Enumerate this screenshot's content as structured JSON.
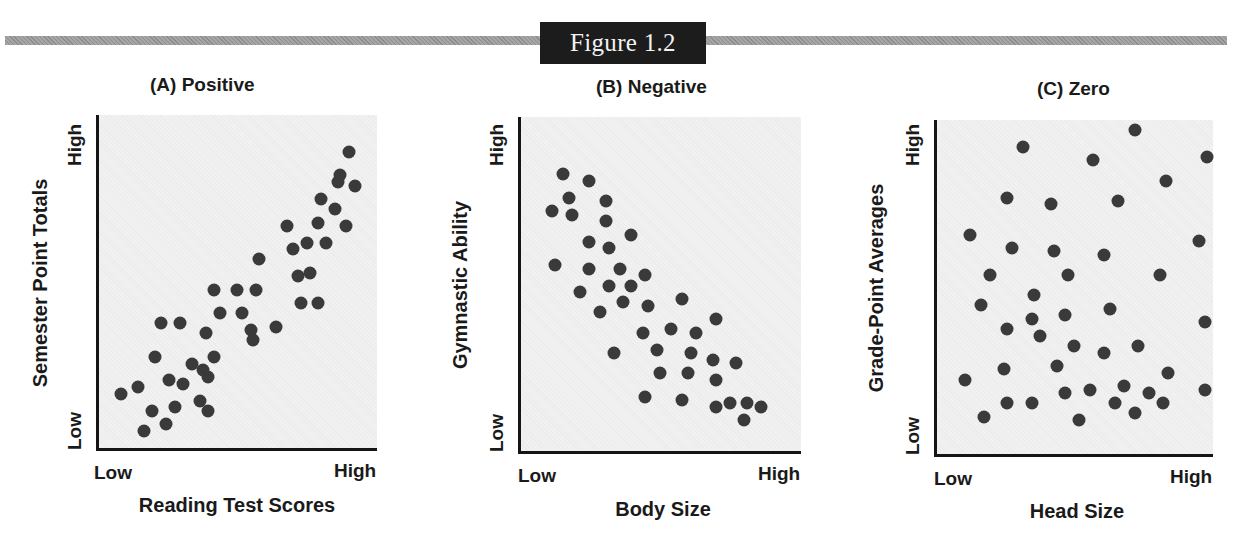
{
  "figure": {
    "label": "Figure 1.2"
  },
  "chart_data": [
    {
      "type": "scatter",
      "title": "(A) Positive",
      "xlabel": "Reading Test Scores",
      "ylabel": "Semester Point Totals",
      "x_ticks": [
        "Low",
        "High"
      ],
      "y_ticks": [
        "Low",
        "High"
      ],
      "xlim": [
        0,
        100
      ],
      "ylim": [
        0,
        100
      ],
      "grid": false,
      "points": [
        [
          9,
          17
        ],
        [
          15,
          19
        ],
        [
          20,
          12
        ],
        [
          17,
          6
        ],
        [
          21,
          28
        ],
        [
          23,
          38
        ],
        [
          25,
          8
        ],
        [
          30,
          38
        ],
        [
          28,
          13
        ],
        [
          26,
          21
        ],
        [
          31,
          20
        ],
        [
          34,
          26
        ],
        [
          37,
          15
        ],
        [
          38,
          24
        ],
        [
          39,
          35
        ],
        [
          40,
          22
        ],
        [
          42,
          28
        ],
        [
          40,
          12
        ],
        [
          42,
          48
        ],
        [
          44,
          41
        ],
        [
          50,
          48
        ],
        [
          52,
          41
        ],
        [
          55,
          36
        ],
        [
          56,
          33
        ],
        [
          57,
          48
        ],
        [
          58,
          57
        ],
        [
          64,
          37
        ],
        [
          70,
          60
        ],
        [
          68,
          67
        ],
        [
          72,
          52
        ],
        [
          73,
          44
        ],
        [
          75,
          62
        ],
        [
          76,
          53
        ],
        [
          79,
          44
        ],
        [
          79,
          68
        ],
        [
          80,
          75
        ],
        [
          82,
          62
        ],
        [
          85,
          72
        ],
        [
          86,
          80
        ],
        [
          89,
          67
        ],
        [
          87,
          82
        ],
        [
          90,
          89
        ],
        [
          92,
          79
        ]
      ]
    },
    {
      "type": "scatter",
      "title": "(B) Negative",
      "xlabel": "Body Size",
      "ylabel": "Gymnastic Ability",
      "x_ticks": [
        "Low",
        "High"
      ],
      "y_ticks": [
        "Low",
        "High"
      ],
      "xlim": [
        0,
        100
      ],
      "ylim": [
        0,
        100
      ],
      "grid": false,
      "points": [
        [
          16,
          83
        ],
        [
          25,
          81
        ],
        [
          18,
          76
        ],
        [
          12,
          72
        ],
        [
          19,
          71
        ],
        [
          31,
          75
        ],
        [
          31,
          69
        ],
        [
          40,
          65
        ],
        [
          25,
          63
        ],
        [
          32,
          61
        ],
        [
          13,
          56
        ],
        [
          25,
          55
        ],
        [
          36,
          55
        ],
        [
          45,
          53
        ],
        [
          22,
          48
        ],
        [
          32,
          50
        ],
        [
          40,
          50
        ],
        [
          37,
          45
        ],
        [
          46,
          44
        ],
        [
          29,
          42
        ],
        [
          58,
          46
        ],
        [
          44,
          36
        ],
        [
          54,
          37
        ],
        [
          63,
          36
        ],
        [
          70,
          40
        ],
        [
          34,
          30
        ],
        [
          49,
          31
        ],
        [
          61,
          30
        ],
        [
          69,
          28
        ],
        [
          77,
          27
        ],
        [
          50,
          24
        ],
        [
          60,
          24
        ],
        [
          70,
          22
        ],
        [
          45,
          17
        ],
        [
          58,
          16
        ],
        [
          70,
          14
        ],
        [
          75,
          15
        ],
        [
          81,
          15
        ],
        [
          86,
          14
        ],
        [
          80,
          10
        ]
      ]
    },
    {
      "type": "scatter",
      "title": "(C) Zero",
      "xlabel": "Head Size",
      "ylabel": "Grade-Point Averages",
      "x_ticks": [
        "Low",
        "High"
      ],
      "y_ticks": [
        "Low",
        "High"
      ],
      "xlim": [
        0,
        100
      ],
      "ylim": [
        0,
        100
      ],
      "grid": false,
      "points": [
        [
          32,
          92
        ],
        [
          57,
          88
        ],
        [
          72,
          97
        ],
        [
          98,
          89
        ],
        [
          26,
          77
        ],
        [
          42,
          75
        ],
        [
          66,
          76
        ],
        [
          83,
          82
        ],
        [
          95,
          64
        ],
        [
          13,
          66
        ],
        [
          28,
          62
        ],
        [
          43,
          61
        ],
        [
          61,
          60
        ],
        [
          20,
          54
        ],
        [
          48,
          54
        ],
        [
          81,
          54
        ],
        [
          36,
          48
        ],
        [
          35,
          41
        ],
        [
          47,
          42
        ],
        [
          63,
          44
        ],
        [
          97,
          40
        ],
        [
          17,
          45
        ],
        [
          26,
          38
        ],
        [
          38,
          36
        ],
        [
          50,
          33
        ],
        [
          73,
          33
        ],
        [
          61,
          31
        ],
        [
          25,
          26
        ],
        [
          44,
          27
        ],
        [
          84,
          25
        ],
        [
          11,
          23
        ],
        [
          56,
          20
        ],
        [
          47,
          19
        ],
        [
          68,
          21
        ],
        [
          77,
          19
        ],
        [
          97,
          20
        ],
        [
          26,
          16
        ],
        [
          35,
          16
        ],
        [
          65,
          16
        ],
        [
          72,
          13
        ],
        [
          82,
          16
        ],
        [
          18,
          12
        ],
        [
          52,
          11
        ]
      ]
    }
  ]
}
